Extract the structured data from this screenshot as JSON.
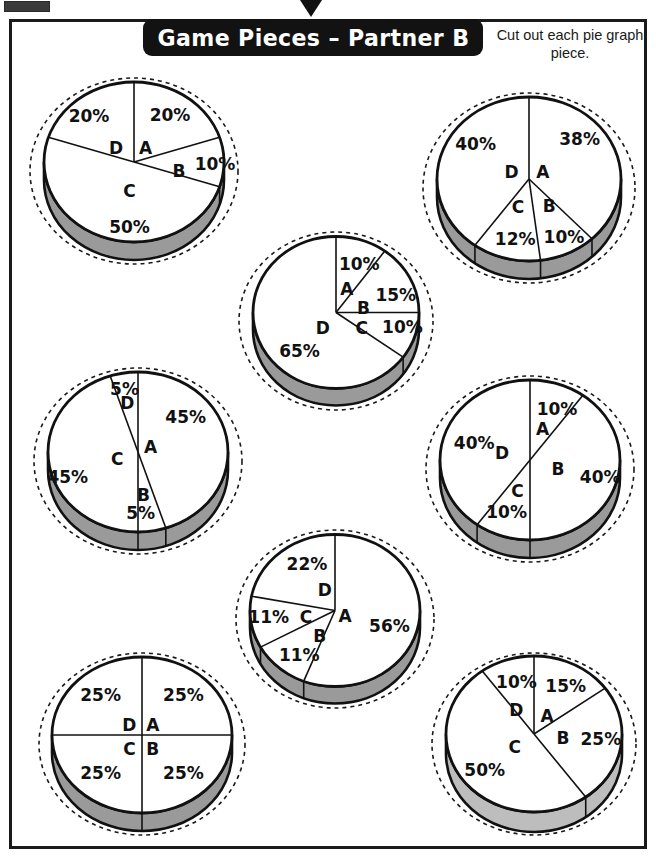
{
  "worksheet": {
    "banner_title": "Game Pieces – Partner B",
    "instructions": "Cut out each pie graph piece.",
    "corner_mark": "registration-bar",
    "top_tab": "page-pointer-tab"
  },
  "colors": {
    "banner_bg": "#121212",
    "banner_text": "#ffffff",
    "outline": "#111111",
    "pie_face": "#ffffff",
    "pie_side_dark": "#9a9a9a",
    "pie_side_light": "#bdbdbd",
    "frame": "#1a1a1a",
    "cut_line": "#1a1a1a"
  },
  "chart_data": [
    {
      "id": "pie-1",
      "type": "pie",
      "title": "Pie Graph 1",
      "position": {
        "x": 22,
        "y": 72,
        "w": 224,
        "h": 198
      },
      "radius_x": 90,
      "radius_y": 80,
      "depth": 18,
      "cut_circle_rx": 104,
      "cut_circle_ry": 93,
      "side_shade": "dark",
      "categories": [
        "A",
        "B",
        "C",
        "D"
      ],
      "values": [
        20,
        10,
        50,
        20
      ],
      "labels": [
        "20%",
        "10%",
        "50%",
        "20%"
      ],
      "label_positions": [
        {
          "text": "20%",
          "x": 0.4,
          "y": -0.58
        },
        {
          "text": "10%",
          "x": 0.9,
          "y": 0.04
        },
        {
          "text": "50%",
          "x": -0.05,
          "y": 0.82
        },
        {
          "text": "20%",
          "x": -0.5,
          "y": -0.56
        }
      ],
      "letter_positions": [
        {
          "text": "A",
          "x": 0.13,
          "y": -0.16
        },
        {
          "text": "B",
          "x": 0.5,
          "y": 0.12
        },
        {
          "text": "C",
          "x": -0.05,
          "y": 0.37
        },
        {
          "text": "D",
          "x": -0.2,
          "y": -0.16
        }
      ]
    },
    {
      "id": "pie-2",
      "type": "pie",
      "title": "Pie Graph 2",
      "position": {
        "x": 415,
        "y": 88,
        "w": 228,
        "h": 200
      },
      "radius_x": 92,
      "radius_y": 82,
      "depth": 18,
      "cut_circle_rx": 106,
      "cut_circle_ry": 95,
      "side_shade": "dark",
      "categories": [
        "A",
        "B",
        "C",
        "D"
      ],
      "values": [
        38,
        10,
        12,
        40
      ],
      "labels": [
        "38%",
        "10%",
        "12%",
        "40%"
      ],
      "label_positions": [
        {
          "text": "38%",
          "x": 0.55,
          "y": -0.47
        },
        {
          "text": "10%",
          "x": 0.38,
          "y": 0.72
        },
        {
          "text": "12%",
          "x": -0.15,
          "y": 0.74
        },
        {
          "text": "40%",
          "x": -0.58,
          "y": -0.42
        }
      ],
      "letter_positions": [
        {
          "text": "A",
          "x": 0.15,
          "y": -0.07
        },
        {
          "text": "B",
          "x": 0.22,
          "y": 0.34
        },
        {
          "text": "C",
          "x": -0.12,
          "y": 0.35
        },
        {
          "text": "D",
          "x": -0.19,
          "y": -0.07
        }
      ]
    },
    {
      "id": "pie-3",
      "type": "pie",
      "title": "Pie Graph 3",
      "position": {
        "x": 233,
        "y": 228,
        "w": 206,
        "h": 186
      },
      "radius_x": 83,
      "radius_y": 76,
      "depth": 17,
      "cut_circle_rx": 97,
      "cut_circle_ry": 89,
      "side_shade": "dark",
      "categories": [
        "A",
        "B",
        "C",
        "D"
      ],
      "values": [
        10,
        15,
        10,
        65
      ],
      "labels": [
        "10%",
        "15%",
        "10%",
        "65%"
      ],
      "label_positions": [
        {
          "text": "10%",
          "x": 0.28,
          "y": -0.62
        },
        {
          "text": "15%",
          "x": 0.72,
          "y": -0.22
        },
        {
          "text": "10%",
          "x": 0.8,
          "y": 0.2
        },
        {
          "text": "65%",
          "x": -0.44,
          "y": 0.52
        }
      ],
      "letter_positions": [
        {
          "text": "A",
          "x": 0.13,
          "y": -0.29
        },
        {
          "text": "B",
          "x": 0.33,
          "y": -0.04
        },
        {
          "text": "C",
          "x": 0.31,
          "y": 0.22
        },
        {
          "text": "D",
          "x": -0.16,
          "y": 0.22
        }
      ]
    },
    {
      "id": "pie-4",
      "type": "pie",
      "title": "Pie Graph 4",
      "position": {
        "x": 26,
        "y": 362,
        "w": 224,
        "h": 198
      },
      "radius_x": 90,
      "radius_y": 80,
      "depth": 18,
      "cut_circle_rx": 104,
      "cut_circle_ry": 93,
      "side_shade": "dark",
      "categories": [
        "A",
        "B",
        "C",
        "D"
      ],
      "values": [
        45,
        5,
        45,
        5
      ],
      "labels": [
        "45%",
        "5%",
        "45%",
        "5%"
      ],
      "label_positions": [
        {
          "text": "45%",
          "x": 0.53,
          "y": -0.42
        },
        {
          "text": "5%",
          "x": 0.03,
          "y": 0.78
        },
        {
          "text": "45%",
          "x": -0.78,
          "y": 0.32
        },
        {
          "text": "5%",
          "x": -0.15,
          "y": -0.77
        }
      ],
      "letter_positions": [
        {
          "text": "A",
          "x": 0.14,
          "y": -0.05
        },
        {
          "text": "B",
          "x": 0.06,
          "y": 0.55
        },
        {
          "text": "C",
          "x": -0.23,
          "y": 0.1
        },
        {
          "text": "D",
          "x": -0.12,
          "y": -0.6
        }
      ]
    },
    {
      "id": "pie-5",
      "type": "pie",
      "title": "Pie Graph 5",
      "position": {
        "x": 418,
        "y": 372,
        "w": 224,
        "h": 194
      },
      "radius_x": 90,
      "radius_y": 80,
      "depth": 18,
      "cut_circle_rx": 104,
      "cut_circle_ry": 93,
      "side_shade": "dark",
      "categories": [
        "A",
        "B",
        "C",
        "D"
      ],
      "values": [
        10,
        40,
        10,
        40
      ],
      "labels": [
        "10%",
        "40%",
        "40%",
        "10%"
      ],
      "label_positions": [
        {
          "text": "10%",
          "x": 0.3,
          "y": -0.63
        },
        {
          "text": "40%",
          "x": 0.78,
          "y": 0.22
        },
        {
          "text": "10%",
          "x": -0.26,
          "y": 0.66
        },
        {
          "text": "40%",
          "x": -0.62,
          "y": -0.2
        }
      ],
      "letter_positions": [
        {
          "text": "A",
          "x": 0.14,
          "y": -0.38
        },
        {
          "text": "B",
          "x": 0.31,
          "y": 0.12
        },
        {
          "text": "C",
          "x": -0.14,
          "y": 0.4
        },
        {
          "text": "D",
          "x": -0.31,
          "y": -0.08
        }
      ]
    },
    {
      "id": "pie-6",
      "type": "pie",
      "title": "Pie Graph 6",
      "position": {
        "x": 232,
        "y": 528,
        "w": 206,
        "h": 182
      },
      "radius_x": 85,
      "radius_y": 76,
      "depth": 17,
      "cut_circle_rx": 99,
      "cut_circle_ry": 89,
      "side_shade": "dark",
      "categories": [
        "A",
        "B",
        "C",
        "D"
      ],
      "values": [
        56,
        11,
        11,
        22
      ],
      "labels": [
        "56%",
        "11%",
        "11%",
        "22%"
      ],
      "label_positions": [
        {
          "text": "56%",
          "x": 0.64,
          "y": 0.22
        },
        {
          "text": "11%",
          "x": -0.42,
          "y": 0.6
        },
        {
          "text": "11%",
          "x": -0.78,
          "y": 0.1
        },
        {
          "text": "22%",
          "x": -0.33,
          "y": -0.6
        }
      ],
      "letter_positions": [
        {
          "text": "A",
          "x": 0.12,
          "y": 0.09
        },
        {
          "text": "B",
          "x": -0.18,
          "y": 0.35
        },
        {
          "text": "C",
          "x": -0.34,
          "y": 0.1
        },
        {
          "text": "D",
          "x": -0.12,
          "y": -0.26
        }
      ]
    },
    {
      "id": "pie-7",
      "type": "pie",
      "title": "Pie Graph 7",
      "position": {
        "x": 32,
        "y": 646,
        "w": 220,
        "h": 196
      },
      "radius_x": 90,
      "radius_y": 78,
      "depth": 18,
      "cut_circle_rx": 103,
      "cut_circle_ry": 91,
      "side_shade": "dark",
      "categories": [
        "A",
        "B",
        "C",
        "D"
      ],
      "values": [
        25,
        25,
        25,
        25
      ],
      "labels": [
        "25%",
        "25%",
        "25%",
        "25%"
      ],
      "label_positions": [
        {
          "text": "25%",
          "x": 0.46,
          "y": -0.5
        },
        {
          "text": "25%",
          "x": 0.46,
          "y": 0.5
        },
        {
          "text": "25%",
          "x": -0.46,
          "y": 0.5
        },
        {
          "text": "25%",
          "x": -0.46,
          "y": -0.5
        }
      ],
      "letter_positions": [
        {
          "text": "A",
          "x": 0.12,
          "y": -0.12
        },
        {
          "text": "B",
          "x": 0.12,
          "y": 0.19
        },
        {
          "text": "C",
          "x": -0.14,
          "y": 0.19
        },
        {
          "text": "D",
          "x": -0.14,
          "y": -0.12
        }
      ]
    },
    {
      "id": "pie-8",
      "type": "pie",
      "title": "Pie Graph 8",
      "position": {
        "x": 424,
        "y": 645,
        "w": 220,
        "h": 198
      },
      "radius_x": 88,
      "radius_y": 78,
      "depth": 20,
      "cut_circle_rx": 102,
      "cut_circle_ry": 91,
      "side_shade": "light",
      "categories": [
        "A",
        "B",
        "C",
        "D"
      ],
      "values": [
        15,
        25,
        50,
        10
      ],
      "labels": [
        "15%",
        "25%",
        "50%",
        "10%"
      ],
      "label_positions": [
        {
          "text": "15%",
          "x": 0.36,
          "y": -0.6
        },
        {
          "text": "25%",
          "x": 0.76,
          "y": 0.08
        },
        {
          "text": "50%",
          "x": -0.56,
          "y": 0.48
        },
        {
          "text": "10%",
          "x": -0.2,
          "y": -0.66
        }
      ],
      "letter_positions": [
        {
          "text": "A",
          "x": 0.15,
          "y": -0.22
        },
        {
          "text": "B",
          "x": 0.33,
          "y": 0.07
        },
        {
          "text": "C",
          "x": -0.22,
          "y": 0.18
        },
        {
          "text": "D",
          "x": -0.2,
          "y": -0.3
        }
      ]
    }
  ]
}
